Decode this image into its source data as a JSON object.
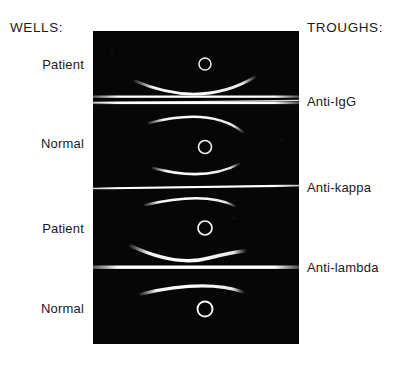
{
  "figure": {
    "background_color": "#ffffff",
    "gel_color": "#050505",
    "precipitin_color": "#f2f2f2"
  },
  "headers": {
    "left": "WELLS:",
    "right": "TROUGHS:"
  },
  "well_labels": [
    {
      "text": "Patient",
      "y": 64
    },
    {
      "text": "Normal",
      "y": 143
    },
    {
      "text": "Patient",
      "y": 228
    },
    {
      "text": "Normal",
      "y": 308
    }
  ],
  "trough_labels": [
    {
      "text": "Anti-IgG",
      "y": 101
    },
    {
      "text": "Anti-kappa",
      "y": 187
    },
    {
      "text": "Anti-lambda",
      "y": 267
    }
  ],
  "gel": {
    "x": 93,
    "y": 31,
    "width": 206,
    "height": 313,
    "troughs": [
      {
        "name": "Anti-IgG",
        "y": 68,
        "thickness": 3.0,
        "double": true
      },
      {
        "name": "Anti-kappa",
        "y": 156,
        "thickness": 2.2,
        "double": false
      },
      {
        "name": "Anti-lambda",
        "y": 236,
        "thickness": 3.2,
        "double": false
      }
    ],
    "wells": [
      {
        "sample": "Patient",
        "cx": 112,
        "cy": 33,
        "r": 6.0
      },
      {
        "sample": "Normal",
        "cx": 112,
        "cy": 116,
        "r": 6.5
      },
      {
        "sample": "Patient",
        "cx": 112,
        "cy": 197,
        "r": 7.0
      },
      {
        "sample": "Normal",
        "cx": 112,
        "cy": 278,
        "r": 7.5
      }
    ],
    "precipitin_arcs": [
      {
        "panel": "Patient-1",
        "position": "below-well",
        "path": "M 42 51 Q 115 77 160 48",
        "width": 2.6
      },
      {
        "panel": "Normal-1",
        "position": "above-well",
        "path": "M 58 91 Q 120 77 148 99",
        "width": 2.4
      },
      {
        "panel": "Normal-1",
        "position": "below-well",
        "path": "M 62 138 Q 115 150 145 134",
        "width": 2.4
      },
      {
        "panel": "Patient-2",
        "position": "above-well",
        "path": "M 55 172 Q 115 160 140 173",
        "width": 2.4
      },
      {
        "panel": "Patient-2",
        "position": "below-well",
        "path": "M 40 216 Q 100 232 150 219",
        "width": 3.2
      },
      {
        "panel": "Normal-2",
        "position": "above-well",
        "path": "M 50 262 Q 112 249 148 260",
        "width": 3.0
      }
    ]
  }
}
